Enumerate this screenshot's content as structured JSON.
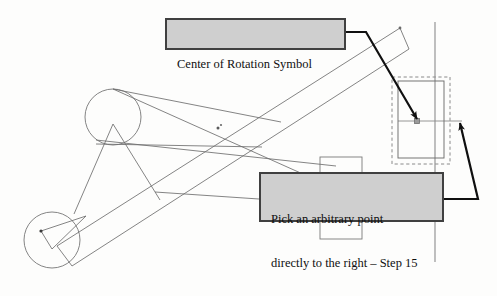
{
  "figure": {
    "background_color": "#fdfdfc",
    "line_color": "#6e6e6e",
    "leader_color": "#101010",
    "callout_fill": "#cfcfcf",
    "callout_border": "#404040"
  },
  "callouts": [
    {
      "id": "center-of-rotation",
      "text": "Center of Rotation Symbol",
      "lines": [
        "Center of Rotation Symbol"
      ],
      "x": 165,
      "y": 18,
      "width": 181,
      "height": 32
    },
    {
      "id": "arbitrary-point",
      "text": "Pick an arbitrary point directly to the right – Step 15",
      "lines": [
        "Pick an arbitrary point",
        "directly to the right – Step 15"
      ],
      "x": 259,
      "y": 172,
      "width": 185,
      "height": 50
    }
  ],
  "annotations": {
    "step_number": "Step 15",
    "rotation_symbol_label": "Center of Rotation Symbol",
    "instruction_line_1": "Pick an arbitrary point",
    "instruction_line_2": "directly to the right – Step 15"
  },
  "geometry": {
    "upper_circle": {
      "cx": 113,
      "cy": 117,
      "r": 28
    },
    "lower_circle": {
      "cx": 52,
      "cy": 240,
      "r": 28
    },
    "center_of_rotation_point": {
      "x": 417,
      "y": 121
    },
    "selection_box_dashed": {
      "x": 392,
      "y": 77,
      "width": 58,
      "height": 87
    },
    "inner_rectangle": {
      "x": 398,
      "y": 81,
      "width": 46,
      "height": 77
    },
    "vertical_axis_x": 435,
    "upper_tab_rect": {
      "x": 320,
      "y": 157,
      "width": 42,
      "height": 30
    },
    "lower_tab_rect": {
      "x": 320,
      "y": 208,
      "width": 42,
      "height": 30
    },
    "marker_upper_band": {
      "x": 218,
      "y": 128
    },
    "marker_lower_circle": {
      "x": 41,
      "y": 231
    }
  }
}
